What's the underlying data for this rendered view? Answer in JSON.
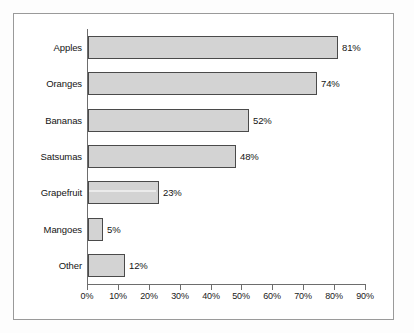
{
  "chart_data": {
    "type": "bar",
    "orientation": "horizontal",
    "title": "",
    "subtitle": "",
    "xlabel": "",
    "ylabel": "",
    "categories": [
      "Apples",
      "Oranges",
      "Bananas",
      "Satsumas",
      "Grapefruit",
      "Mangoes",
      "Other"
    ],
    "values": [
      81,
      74,
      52,
      48,
      23,
      5,
      12
    ],
    "value_labels": [
      "81%",
      "74%",
      "52%",
      "48%",
      "23%",
      "5%",
      "12%"
    ],
    "xlim": [
      0,
      90
    ],
    "xtick_values": [
      0,
      10,
      20,
      30,
      40,
      50,
      60,
      70,
      80,
      90
    ],
    "xtick_labels": [
      "0%",
      "10%",
      "20%",
      "30%",
      "40%",
      "50%",
      "60%",
      "70%",
      "80%",
      "90%"
    ],
    "grid": false,
    "legend": null,
    "legend_position": "none",
    "series": [
      {
        "name": "",
        "values": [
          81,
          74,
          52,
          48,
          23,
          5,
          12
        ]
      }
    ],
    "colors": {
      "bar_fill": "#d3d3d3",
      "bar_border": "#4a4a4a",
      "axis": "#6d6d6d",
      "text": "#141414",
      "frame": "#9a9a9a",
      "background": "#ffffff"
    }
  }
}
